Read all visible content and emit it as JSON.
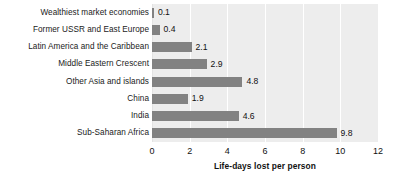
{
  "chart_data": {
    "type": "bar",
    "orientation": "horizontal",
    "title": "",
    "subtitle": "",
    "xlabel": "Life-days lost per person",
    "ylabel": "",
    "categories": [
      "Wealthiest market economies",
      "Former USSR and East Europe",
      "Latin America and the Caribbean",
      "Middle Eastern Crescent",
      "Other Asia and islands",
      "China",
      "India",
      "Sub-Saharan Africa"
    ],
    "values": [
      0.1,
      0.4,
      2.1,
      2.9,
      4.8,
      1.9,
      4.6,
      9.8
    ],
    "value_labels": [
      "0.1",
      "0.4",
      "2.1",
      "2.9",
      "4.8",
      "1.9",
      "4.6",
      "9.8"
    ],
    "xlim": [
      0,
      12
    ],
    "xticks": [
      0,
      2,
      4,
      6,
      8,
      10,
      12
    ],
    "xtick_labels": [
      "0",
      "2",
      "4",
      "6",
      "8",
      "10",
      "12"
    ],
    "grid": "vertical-white",
    "legend": "none",
    "colors": {
      "bar": "#828282",
      "plot_background": "#ededed",
      "figure_background": "#ffffff",
      "gridline": "#ffffff",
      "text": "#111111"
    }
  }
}
